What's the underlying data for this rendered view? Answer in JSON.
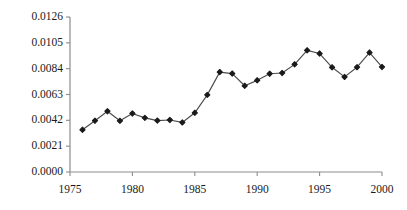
{
  "chart_data": {
    "type": "line",
    "title": "",
    "subtitle": "",
    "xlabel": "",
    "ylabel": "",
    "xlim": [
      1975,
      2000
    ],
    "ylim": [
      0.0,
      0.0126
    ],
    "grid": false,
    "legend": null,
    "marker": "diamond",
    "line_color": "#4d4d4d",
    "marker_color": "#1a1a1a",
    "axis_color": "#808080",
    "x_ticks": [
      1975,
      1980,
      1985,
      1990,
      1995,
      2000
    ],
    "x_tick_labels": [
      "1975",
      "1980",
      "1985",
      "1990",
      "1995",
      "2000"
    ],
    "y_ticks": [
      0.0,
      0.0021,
      0.0042,
      0.0063,
      0.0084,
      0.0105,
      0.0126
    ],
    "y_tick_labels": [
      "0.0000",
      "0.0021",
      "0.0042",
      "0.0063",
      "0.0084",
      "0.0105",
      "0.0126"
    ],
    "x": [
      1976,
      1977,
      1978,
      1979,
      1980,
      1981,
      1982,
      1983,
      1984,
      1985,
      1986,
      1987,
      1988,
      1989,
      1990,
      1991,
      1992,
      1993,
      1994,
      1995,
      1996,
      1997,
      1998,
      1999,
      2000
    ],
    "values": [
      0.00343,
      0.00417,
      0.00494,
      0.00416,
      0.00476,
      0.0044,
      0.00418,
      0.00423,
      0.00403,
      0.00481,
      0.00627,
      0.00812,
      0.008,
      0.00701,
      0.00745,
      0.00799,
      0.00805,
      0.00875,
      0.00989,
      0.00963,
      0.00851,
      0.00773,
      0.00852,
      0.00971,
      0.00854
    ],
    "series": [
      {
        "name": "series-1",
        "values": [
          0.00343,
          0.00417,
          0.00494,
          0.00416,
          0.00476,
          0.0044,
          0.00418,
          0.00423,
          0.00403,
          0.00481,
          0.00627,
          0.00812,
          0.008,
          0.00701,
          0.00745,
          0.00799,
          0.00805,
          0.00875,
          0.00989,
          0.00963,
          0.00851,
          0.00773,
          0.00852,
          0.00971,
          0.00854
        ]
      }
    ]
  }
}
